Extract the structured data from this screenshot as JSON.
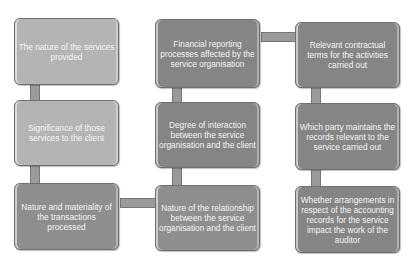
{
  "diagram": {
    "type": "flow-grid",
    "columns": 3,
    "rows": 3,
    "boxes": [
      {
        "col": 1,
        "row": 1,
        "text": "The nature of the services provided"
      },
      {
        "col": 1,
        "row": 2,
        "text": "Significance of those services to the client"
      },
      {
        "col": 1,
        "row": 3,
        "text": "Nature and materiality of the transactions processed"
      },
      {
        "col": 2,
        "row": 1,
        "text": "Financial reporting processes affected by the service organisation"
      },
      {
        "col": 2,
        "row": 2,
        "text": "Degree of interaction between the service organisation and the client"
      },
      {
        "col": 2,
        "row": 3,
        "text": "Nature of the relationship between the service organisation and the client"
      },
      {
        "col": 3,
        "row": 1,
        "text": "Relevant contractual terms for the activities carried out"
      },
      {
        "col": 3,
        "row": 2,
        "text": "Which party maintains the records relevant to the service carried out"
      },
      {
        "col": 3,
        "row": 3,
        "text": "Whether arrangements in respect of the accounting records for the service impact the work of the auditor"
      }
    ],
    "colors": {
      "box_light": "#b4b4b4",
      "box_mid": "#8e8e8e",
      "box_dark": "#858585",
      "connector": "#9a9a9a",
      "text": "#f4f4f4"
    }
  }
}
